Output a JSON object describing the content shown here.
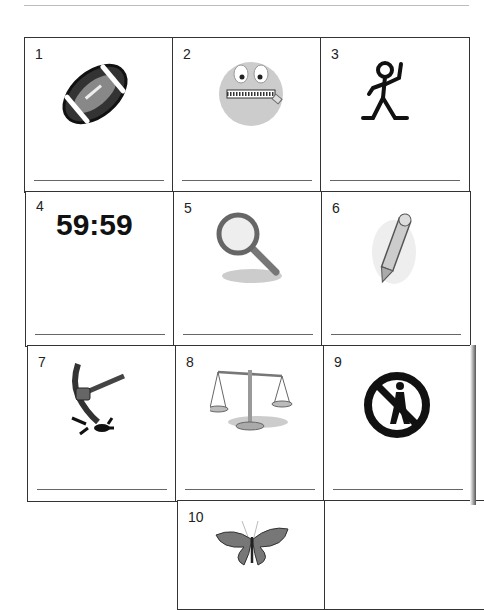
{
  "worksheet": {
    "cells": [
      {
        "number": "1",
        "icon": "football-icon"
      },
      {
        "number": "2",
        "icon": "zipped-mouth-face-icon"
      },
      {
        "number": "3",
        "icon": "stick-figure-icon"
      },
      {
        "number": "4",
        "text": "59:59",
        "icon": "timer-text"
      },
      {
        "number": "5",
        "icon": "magnifying-glass-icon"
      },
      {
        "number": "6",
        "icon": "pencil-icon"
      },
      {
        "number": "7",
        "icon": "pickaxe-icon"
      },
      {
        "number": "8",
        "icon": "scales-icon"
      },
      {
        "number": "9",
        "icon": "no-pedestrian-icon"
      },
      {
        "number": "10",
        "icon": "butterfly-icon"
      }
    ]
  }
}
